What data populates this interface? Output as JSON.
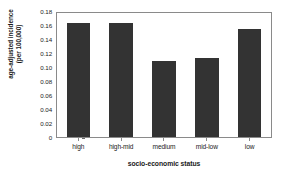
{
  "chart_data": {
    "type": "bar",
    "title": "",
    "subtitle": "",
    "xlabel": "socio-economic status",
    "ylabel_line1": "age-adjusted incidence",
    "ylabel_line2": "(per 100,000)",
    "categories": [
      "high",
      "high-mid",
      "medium",
      "mid-low",
      "low"
    ],
    "values": [
      0.165,
      0.165,
      0.11,
      0.115,
      0.157
    ],
    "series": [
      {
        "name": "age-adjusted incidence",
        "values": [
          0.165,
          0.165,
          0.11,
          0.115,
          0.157
        ]
      }
    ],
    "ylim": [
      0,
      0.18
    ],
    "ytick_labels": [
      "0.18",
      "0.16",
      "0.14",
      "0.12",
      "0.10",
      "0.08",
      "0.06",
      "0.04",
      "0.02",
      "0"
    ],
    "ytick_values": [
      0.18,
      0.16,
      0.14,
      0.12,
      0.1,
      0.08,
      0.06,
      0.04,
      0.02,
      0
    ],
    "grid": false,
    "legend": false,
    "legend_position": "none",
    "bar_color": "#333333",
    "frame_color": "#8a8a8a",
    "background_color": "#ffffff",
    "annotations": []
  }
}
